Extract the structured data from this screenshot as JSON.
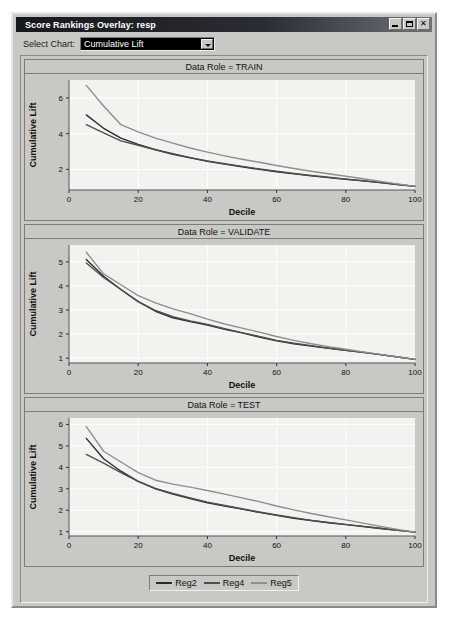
{
  "window": {
    "title": "Score Rankings Overlay: resp",
    "minimize_label": "Minimize",
    "maximize_label": "Maximize",
    "close_label": "✕"
  },
  "toolbar": {
    "select_chart_label": "Select Chart:",
    "chart_value": "Cumulative Lift"
  },
  "legend": {
    "items": [
      {
        "label": "Reg2",
        "color": "#2b2b2b"
      },
      {
        "label": "Reg4",
        "color": "#4f4f4f"
      },
      {
        "label": "Reg5",
        "color": "#8e8e8e"
      }
    ]
  },
  "chart_data": [
    {
      "type": "line",
      "title": "Data Role = TRAIN",
      "xlabel": "Decile",
      "ylabel": "Cumulative Lift",
      "xlim": [
        0,
        100
      ],
      "ylim": [
        0.85,
        7.0
      ],
      "xticks": [
        0,
        20,
        40,
        60,
        80,
        100
      ],
      "yticks": [
        2,
        4,
        6
      ],
      "grid": true,
      "legend_position": "bottom",
      "x": [
        5,
        10,
        15,
        20,
        25,
        30,
        35,
        40,
        45,
        50,
        55,
        60,
        65,
        70,
        75,
        80,
        85,
        90,
        95,
        100
      ],
      "series": [
        {
          "name": "Reg2",
          "color": "#2b2b2b",
          "values": [
            5.05,
            4.3,
            3.75,
            3.4,
            3.1,
            2.85,
            2.65,
            2.45,
            2.3,
            2.15,
            2.0,
            1.87,
            1.75,
            1.64,
            1.54,
            1.45,
            1.36,
            1.26,
            1.16,
            1.05
          ]
        },
        {
          "name": "Reg4",
          "color": "#4f4f4f",
          "values": [
            4.5,
            4.05,
            3.6,
            3.35,
            3.1,
            2.88,
            2.66,
            2.48,
            2.32,
            2.17,
            2.03,
            1.9,
            1.78,
            1.66,
            1.56,
            1.46,
            1.37,
            1.27,
            1.16,
            1.05
          ]
        },
        {
          "name": "Reg5",
          "color": "#8e8e8e",
          "values": [
            6.7,
            5.55,
            4.5,
            4.1,
            3.75,
            3.47,
            3.2,
            2.97,
            2.76,
            2.57,
            2.4,
            2.22,
            2.05,
            1.9,
            1.76,
            1.62,
            1.48,
            1.33,
            1.19,
            1.05
          ]
        }
      ]
    },
    {
      "type": "line",
      "title": "Data Role = VALIDATE",
      "xlabel": "Decile",
      "ylabel": "Cumulative Lift",
      "xlim": [
        0,
        100
      ],
      "ylim": [
        0.8,
        5.7
      ],
      "xticks": [
        0,
        20,
        40,
        60,
        80,
        100
      ],
      "yticks": [
        1,
        2,
        3,
        4,
        5
      ],
      "grid": true,
      "legend_position": "bottom",
      "x": [
        5,
        10,
        15,
        20,
        25,
        30,
        35,
        40,
        45,
        50,
        55,
        60,
        65,
        70,
        75,
        80,
        85,
        90,
        95,
        100
      ],
      "series": [
        {
          "name": "Reg2",
          "color": "#2b2b2b",
          "values": [
            5.1,
            4.4,
            3.85,
            3.35,
            2.95,
            2.68,
            2.52,
            2.38,
            2.2,
            2.05,
            1.88,
            1.72,
            1.6,
            1.5,
            1.41,
            1.33,
            1.24,
            1.15,
            1.05,
            0.95
          ]
        },
        {
          "name": "Reg4",
          "color": "#4f4f4f",
          "values": [
            4.95,
            4.35,
            3.85,
            3.35,
            2.98,
            2.72,
            2.55,
            2.4,
            2.22,
            2.06,
            1.9,
            1.74,
            1.62,
            1.52,
            1.42,
            1.33,
            1.24,
            1.15,
            1.05,
            0.95
          ]
        },
        {
          "name": "Reg5",
          "color": "#8e8e8e",
          "values": [
            5.4,
            4.5,
            4.05,
            3.6,
            3.3,
            3.05,
            2.85,
            2.62,
            2.42,
            2.25,
            2.08,
            1.9,
            1.74,
            1.6,
            1.48,
            1.37,
            1.26,
            1.16,
            1.05,
            0.95
          ]
        }
      ]
    },
    {
      "type": "line",
      "title": "Data Role = TEST",
      "xlabel": "Decile",
      "ylabel": "Cumulative Lift",
      "xlim": [
        0,
        100
      ],
      "ylim": [
        0.8,
        6.3
      ],
      "xticks": [
        0,
        20,
        40,
        60,
        80,
        100
      ],
      "yticks": [
        1,
        2,
        3,
        4,
        5,
        6
      ],
      "grid": true,
      "legend_position": "bottom",
      "x": [
        5,
        10,
        15,
        20,
        25,
        30,
        35,
        40,
        45,
        50,
        55,
        60,
        65,
        70,
        75,
        80,
        85,
        90,
        95,
        100
      ],
      "series": [
        {
          "name": "Reg2",
          "color": "#2b2b2b",
          "values": [
            5.35,
            4.4,
            3.82,
            3.35,
            3.0,
            2.75,
            2.55,
            2.35,
            2.2,
            2.05,
            1.9,
            1.76,
            1.63,
            1.52,
            1.42,
            1.33,
            1.24,
            1.15,
            1.06,
            0.98
          ]
        },
        {
          "name": "Reg4",
          "color": "#4f4f4f",
          "values": [
            4.6,
            4.2,
            3.75,
            3.35,
            3.02,
            2.78,
            2.58,
            2.38,
            2.22,
            2.07,
            1.92,
            1.78,
            1.65,
            1.53,
            1.43,
            1.34,
            1.25,
            1.16,
            1.07,
            0.98
          ]
        },
        {
          "name": "Reg5",
          "color": "#8e8e8e",
          "values": [
            5.9,
            4.75,
            4.25,
            3.75,
            3.4,
            3.22,
            3.08,
            2.92,
            2.75,
            2.58,
            2.4,
            2.2,
            2.02,
            1.85,
            1.7,
            1.55,
            1.4,
            1.25,
            1.1,
            0.98
          ]
        }
      ]
    }
  ]
}
